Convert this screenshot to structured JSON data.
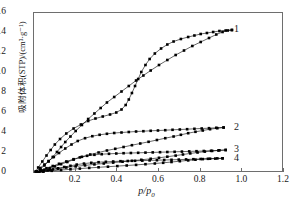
{
  "chart_data": {
    "type": "line",
    "title": "",
    "xlabel": "p/p0",
    "xlabel_display": "p/p",
    "xlabel_sub": "0",
    "ylabel": "吸附体积(STP)/(cm³·g⁻¹)",
    "xlim": [
      0,
      1.2
    ],
    "ylim": [
      0,
      16
    ],
    "xticks": [
      0.2,
      0.4,
      0.6,
      0.8,
      1.0,
      1.2
    ],
    "xtick_labels": [
      "0.2",
      "0.4",
      "0.6",
      "0.8",
      "1.0",
      "1.2"
    ],
    "yticks": [
      0,
      2,
      4,
      6,
      8,
      10,
      12,
      14,
      16
    ],
    "ytick_labels": [
      "0",
      "2",
      "4",
      "6",
      "8",
      "10",
      "12",
      "14",
      "16"
    ],
    "grid": false,
    "legend_position": "inline-right",
    "marker": "filled-square",
    "line_color": "#000000",
    "frame_color": "#6e6e6e",
    "series": [
      {
        "name": "1",
        "label": "1",
        "label_x": 0.965,
        "label_y": 14.35,
        "adsorption": [
          [
            0.01,
            0.15
          ],
          [
            0.03,
            0.4
          ],
          [
            0.05,
            0.75
          ],
          [
            0.07,
            1.15
          ],
          [
            0.09,
            1.6
          ],
          [
            0.11,
            2.1
          ],
          [
            0.13,
            2.6
          ],
          [
            0.15,
            3.1
          ],
          [
            0.175,
            3.65
          ],
          [
            0.2,
            4.2
          ],
          [
            0.23,
            4.8
          ],
          [
            0.26,
            5.4
          ],
          [
            0.29,
            5.95
          ],
          [
            0.32,
            6.5
          ],
          [
            0.35,
            7.05
          ],
          [
            0.385,
            7.6
          ],
          [
            0.42,
            8.15
          ],
          [
            0.455,
            8.7
          ],
          [
            0.49,
            9.25
          ],
          [
            0.525,
            9.75
          ],
          [
            0.56,
            10.25
          ],
          [
            0.6,
            10.8
          ],
          [
            0.64,
            11.3
          ],
          [
            0.68,
            11.8
          ],
          [
            0.72,
            12.25
          ],
          [
            0.76,
            12.7
          ],
          [
            0.8,
            13.1
          ],
          [
            0.84,
            13.5
          ],
          [
            0.875,
            13.85
          ],
          [
            0.905,
            14.1
          ],
          [
            0.93,
            14.25
          ],
          [
            0.95,
            14.3
          ]
        ],
        "desorption": [
          [
            0.95,
            14.3
          ],
          [
            0.92,
            14.25
          ],
          [
            0.89,
            14.2
          ],
          [
            0.86,
            14.1
          ],
          [
            0.83,
            14.0
          ],
          [
            0.8,
            13.9
          ],
          [
            0.77,
            13.75
          ],
          [
            0.74,
            13.6
          ],
          [
            0.705,
            13.4
          ],
          [
            0.67,
            13.15
          ],
          [
            0.64,
            12.85
          ],
          [
            0.61,
            12.45
          ],
          [
            0.58,
            11.95
          ],
          [
            0.555,
            11.4
          ],
          [
            0.535,
            10.8
          ],
          [
            0.515,
            10.1
          ],
          [
            0.5,
            9.4
          ],
          [
            0.485,
            8.7
          ],
          [
            0.47,
            8.0
          ],
          [
            0.455,
            7.35
          ],
          [
            0.44,
            6.8
          ],
          [
            0.42,
            6.35
          ],
          [
            0.395,
            6.05
          ],
          [
            0.365,
            5.85
          ],
          [
            0.33,
            5.65
          ],
          [
            0.295,
            5.45
          ],
          [
            0.26,
            5.2
          ],
          [
            0.225,
            4.85
          ],
          [
            0.19,
            4.45
          ],
          [
            0.155,
            3.95
          ],
          [
            0.125,
            3.4
          ],
          [
            0.1,
            2.85
          ],
          [
            0.08,
            2.3
          ],
          [
            0.06,
            1.75
          ],
          [
            0.04,
            1.15
          ],
          [
            0.02,
            0.55
          ],
          [
            0.008,
            0.15
          ]
        ]
      },
      {
        "name": "2",
        "label": "2",
        "label_x": 0.965,
        "label_y": 4.55,
        "adsorption": [
          [
            0.012,
            0.1
          ],
          [
            0.035,
            0.28
          ],
          [
            0.06,
            0.48
          ],
          [
            0.09,
            0.7
          ],
          [
            0.12,
            0.92
          ],
          [
            0.155,
            1.15
          ],
          [
            0.19,
            1.38
          ],
          [
            0.23,
            1.62
          ],
          [
            0.27,
            1.85
          ],
          [
            0.31,
            2.05
          ],
          [
            0.35,
            2.25
          ],
          [
            0.39,
            2.42
          ],
          [
            0.43,
            2.6
          ],
          [
            0.47,
            2.78
          ],
          [
            0.51,
            2.95
          ],
          [
            0.55,
            3.12
          ],
          [
            0.59,
            3.3
          ],
          [
            0.63,
            3.48
          ],
          [
            0.67,
            3.65
          ],
          [
            0.705,
            3.82
          ],
          [
            0.74,
            3.98
          ],
          [
            0.775,
            4.12
          ],
          [
            0.81,
            4.25
          ],
          [
            0.845,
            4.38
          ],
          [
            0.88,
            4.48
          ],
          [
            0.91,
            4.55
          ]
        ],
        "desorption": [
          [
            0.91,
            4.55
          ],
          [
            0.875,
            4.52
          ],
          [
            0.84,
            4.48
          ],
          [
            0.805,
            4.45
          ],
          [
            0.77,
            4.42
          ],
          [
            0.735,
            4.38
          ],
          [
            0.7,
            4.35
          ],
          [
            0.665,
            4.32
          ],
          [
            0.63,
            4.28
          ],
          [
            0.595,
            4.25
          ],
          [
            0.56,
            4.22
          ],
          [
            0.525,
            4.18
          ],
          [
            0.49,
            4.15
          ],
          [
            0.455,
            4.1
          ],
          [
            0.42,
            4.05
          ],
          [
            0.385,
            4.0
          ],
          [
            0.35,
            3.92
          ],
          [
            0.315,
            3.82
          ],
          [
            0.28,
            3.68
          ],
          [
            0.245,
            3.48
          ],
          [
            0.21,
            3.2
          ],
          [
            0.18,
            2.85
          ],
          [
            0.15,
            2.45
          ],
          [
            0.12,
            2.0
          ],
          [
            0.095,
            1.6
          ],
          [
            0.07,
            1.2
          ],
          [
            0.05,
            0.85
          ],
          [
            0.03,
            0.5
          ],
          [
            0.012,
            0.18
          ]
        ]
      },
      {
        "name": "3",
        "label": "3",
        "label_x": 0.965,
        "label_y": 2.3,
        "adsorption": [
          [
            0.012,
            0.08
          ],
          [
            0.04,
            0.2
          ],
          [
            0.075,
            0.32
          ],
          [
            0.115,
            0.44
          ],
          [
            0.155,
            0.55
          ],
          [
            0.2,
            0.66
          ],
          [
            0.245,
            0.76
          ],
          [
            0.29,
            0.86
          ],
          [
            0.335,
            0.95
          ],
          [
            0.38,
            1.04
          ],
          [
            0.425,
            1.13
          ],
          [
            0.47,
            1.22
          ],
          [
            0.515,
            1.32
          ],
          [
            0.56,
            1.42
          ],
          [
            0.6,
            1.52
          ],
          [
            0.64,
            1.63
          ],
          [
            0.68,
            1.74
          ],
          [
            0.715,
            1.85
          ],
          [
            0.75,
            1.96
          ],
          [
            0.785,
            2.05
          ],
          [
            0.82,
            2.14
          ],
          [
            0.855,
            2.21
          ],
          [
            0.89,
            2.27
          ],
          [
            0.92,
            2.3
          ]
        ],
        "desorption": [
          [
            0.92,
            2.3
          ],
          [
            0.885,
            2.25
          ],
          [
            0.85,
            2.22
          ],
          [
            0.815,
            2.2
          ],
          [
            0.78,
            2.18
          ],
          [
            0.745,
            2.16
          ],
          [
            0.71,
            2.14
          ],
          [
            0.675,
            2.12
          ],
          [
            0.64,
            2.1
          ],
          [
            0.605,
            2.08
          ],
          [
            0.57,
            2.06
          ],
          [
            0.535,
            2.04
          ],
          [
            0.5,
            2.02
          ],
          [
            0.465,
            2.0
          ],
          [
            0.43,
            1.98
          ],
          [
            0.395,
            1.95
          ],
          [
            0.36,
            1.92
          ],
          [
            0.325,
            1.88
          ],
          [
            0.29,
            1.82
          ],
          [
            0.255,
            1.72
          ],
          [
            0.22,
            1.56
          ],
          [
            0.19,
            1.34
          ],
          [
            0.16,
            1.1
          ],
          [
            0.13,
            0.88
          ],
          [
            0.1,
            0.66
          ],
          [
            0.075,
            0.48
          ],
          [
            0.05,
            0.32
          ],
          [
            0.03,
            0.18
          ],
          [
            0.012,
            0.06
          ]
        ]
      },
      {
        "name": "4",
        "label": "4",
        "label_x": 0.965,
        "label_y": 1.45,
        "adsorption": [
          [
            0.012,
            0.05
          ],
          [
            0.045,
            0.14
          ],
          [
            0.085,
            0.22
          ],
          [
            0.13,
            0.3
          ],
          [
            0.175,
            0.37
          ],
          [
            0.22,
            0.44
          ],
          [
            0.265,
            0.51
          ],
          [
            0.31,
            0.57
          ],
          [
            0.355,
            0.63
          ],
          [
            0.4,
            0.69
          ],
          [
            0.445,
            0.75
          ],
          [
            0.49,
            0.81
          ],
          [
            0.535,
            0.88
          ],
          [
            0.58,
            0.95
          ],
          [
            0.62,
            1.02
          ],
          [
            0.66,
            1.1
          ],
          [
            0.7,
            1.18
          ],
          [
            0.74,
            1.26
          ],
          [
            0.775,
            1.33
          ],
          [
            0.81,
            1.39
          ],
          [
            0.845,
            1.43
          ],
          [
            0.88,
            1.46
          ],
          [
            0.905,
            1.47
          ]
        ],
        "desorption": [
          [
            0.905,
            1.47
          ],
          [
            0.87,
            1.44
          ],
          [
            0.835,
            1.42
          ],
          [
            0.8,
            1.4
          ],
          [
            0.765,
            1.38
          ],
          [
            0.73,
            1.36
          ],
          [
            0.695,
            1.34
          ],
          [
            0.66,
            1.32
          ],
          [
            0.625,
            1.3
          ],
          [
            0.59,
            1.28
          ],
          [
            0.555,
            1.26
          ],
          [
            0.52,
            1.24
          ],
          [
            0.485,
            1.22
          ],
          [
            0.45,
            1.2
          ],
          [
            0.415,
            1.18
          ],
          [
            0.38,
            1.15
          ],
          [
            0.345,
            1.12
          ],
          [
            0.31,
            1.08
          ],
          [
            0.275,
            1.02
          ],
          [
            0.24,
            0.94
          ],
          [
            0.205,
            0.84
          ],
          [
            0.175,
            0.72
          ],
          [
            0.145,
            0.6
          ],
          [
            0.115,
            0.47
          ],
          [
            0.09,
            0.36
          ],
          [
            0.065,
            0.26
          ],
          [
            0.045,
            0.17
          ],
          [
            0.025,
            0.1
          ],
          [
            0.01,
            0.04
          ]
        ]
      }
    ]
  }
}
